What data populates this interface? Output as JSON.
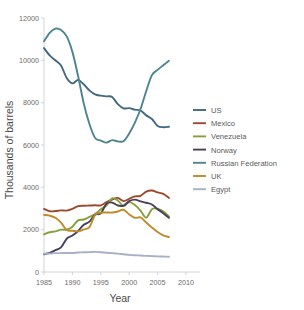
{
  "chart_data": {
    "type": "line",
    "title": "",
    "xlabel": "Year",
    "ylabel": "Thousands of barrels",
    "xlim": [
      1985,
      2010
    ],
    "ylim": [
      0,
      12000
    ],
    "xticks": [
      1985,
      1990,
      1995,
      2000,
      2005,
      2010
    ],
    "yticks": [
      0,
      2000,
      4000,
      6000,
      8000,
      10000,
      12000
    ],
    "grid": false,
    "legend_position": "right",
    "x": [
      1985,
      1986,
      1987,
      1988,
      1989,
      1990,
      1991,
      1992,
      1993,
      1994,
      1995,
      1996,
      1997,
      1998,
      1999,
      2000,
      2001,
      2002,
      2003,
      2004,
      2005,
      2006,
      2007
    ],
    "series": [
      {
        "name": "US",
        "color": "#41697f",
        "values": [
          10580,
          10230,
          10000,
          9760,
          9160,
          8910,
          9070,
          8870,
          8580,
          8390,
          8330,
          8300,
          8270,
          7930,
          7730,
          7740,
          7670,
          7630,
          7400,
          7230,
          6900,
          6840,
          6860
        ]
      },
      {
        "name": "Mexico",
        "color": "#9c4a2e",
        "values": [
          2980,
          2870,
          2880,
          2910,
          2900,
          2980,
          3110,
          3130,
          3140,
          3150,
          3150,
          3300,
          3420,
          3500,
          3350,
          3460,
          3570,
          3600,
          3800,
          3850,
          3760,
          3690,
          3500
        ]
      },
      {
        "name": "Venezuela",
        "color": "#86a13c",
        "values": [
          1780,
          1880,
          1920,
          2000,
          2000,
          2140,
          2440,
          2480,
          2600,
          2740,
          2960,
          3140,
          3480,
          3380,
          3120,
          3300,
          3160,
          2900,
          2570,
          2970,
          2980,
          2870,
          2620
        ]
      },
      {
        "name": "Norway",
        "color": "#4a4056",
        "values": [
          840,
          900,
          1030,
          1160,
          1570,
          1720,
          1940,
          2230,
          2380,
          2710,
          2770,
          3230,
          3280,
          3140,
          3140,
          3350,
          3420,
          3340,
          3270,
          3190,
          2970,
          2780,
          2560
        ]
      },
      {
        "name": "Russian Federation",
        "color": "#4e8490",
        "values": [
          10900,
          11300,
          11500,
          11430,
          11130,
          10400,
          9260,
          7960,
          6990,
          6330,
          6210,
          6110,
          6230,
          6170,
          6180,
          6540,
          7060,
          7700,
          8550,
          9300,
          9550,
          9770,
          9980
        ]
      },
      {
        "name": "UK",
        "color": "#c08a2b",
        "values": [
          2700,
          2660,
          2560,
          2330,
          1980,
          1950,
          1920,
          2010,
          2120,
          2700,
          2800,
          2810,
          2810,
          2860,
          2940,
          2720,
          2560,
          2580,
          2340,
          2100,
          1890,
          1730,
          1650
        ]
      },
      {
        "name": "Egypt",
        "color": "#a6b0c8",
        "values": [
          860,
          870,
          890,
          890,
          900,
          900,
          920,
          930,
          940,
          950,
          930,
          910,
          890,
          870,
          840,
          810,
          790,
          780,
          760,
          750,
          740,
          730,
          720
        ]
      }
    ]
  },
  "axis": {
    "y_title": "Thousands of barrels",
    "x_title": "Year",
    "y_tick_labels": [
      "0",
      "2000",
      "4000",
      "6000",
      "8000",
      "10000",
      "12000"
    ],
    "x_tick_labels": [
      "1985",
      "1990",
      "1995",
      "2000",
      "2005",
      "2010"
    ]
  },
  "legend": {
    "items": [
      {
        "label": "US",
        "color": "#41697f"
      },
      {
        "label": "Mexico",
        "color": "#9c4a2e"
      },
      {
        "label": "Venezuela",
        "color": "#86a13c"
      },
      {
        "label": "Norway",
        "color": "#4a4056"
      },
      {
        "label": "Russian Federation",
        "color": "#4e8490"
      },
      {
        "label": "UK",
        "color": "#c08a2b"
      },
      {
        "label": "Egypt",
        "color": "#a6b0c8"
      }
    ]
  }
}
